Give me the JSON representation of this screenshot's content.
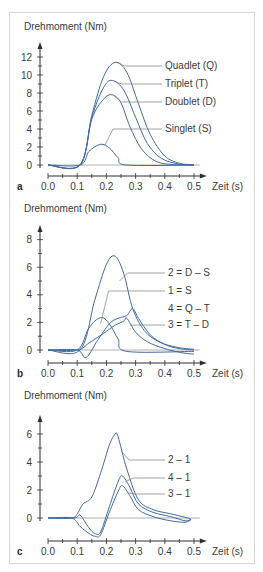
{
  "chart_data": [
    {
      "panel": "a",
      "type": "line",
      "ylabel": "Drehmoment (Nm)",
      "xlabel": "Zeit (s)",
      "xticks": [
        "0.0",
        "0.1",
        "0.2",
        "0.3",
        "0.4",
        "0.5"
      ],
      "yticks": [
        "0",
        "2",
        "4",
        "6",
        "8",
        "10",
        "12"
      ],
      "xlim": [
        0,
        0.5
      ],
      "ylim": [
        0,
        12
      ],
      "grid": false,
      "series": [
        {
          "name": "Quadlet (Q)",
          "x": [
            0,
            0.11,
            0.15,
            0.19,
            0.23,
            0.27,
            0.31,
            0.35,
            0.4,
            0.45,
            0.5
          ],
          "y": [
            0,
            0,
            5.5,
            9.8,
            11.4,
            10.3,
            6.8,
            3.4,
            1.0,
            0.2,
            0
          ]
        },
        {
          "name": "Triplet (T)",
          "x": [
            0,
            0.11,
            0.15,
            0.19,
            0.22,
            0.26,
            0.3,
            0.34,
            0.39,
            0.45,
            0.5
          ],
          "y": [
            0,
            0,
            5.3,
            8.6,
            9.4,
            8.3,
            5.3,
            2.4,
            0.7,
            0.1,
            0
          ]
        },
        {
          "name": "Doublet (D)",
          "x": [
            0,
            0.11,
            0.15,
            0.19,
            0.22,
            0.25,
            0.28,
            0.32,
            0.37,
            0.43,
            0.5
          ],
          "y": [
            0,
            0,
            5.1,
            7.3,
            7.8,
            6.9,
            4.3,
            1.8,
            0.4,
            0.05,
            0
          ]
        },
        {
          "name": "Singlet (S)",
          "x": [
            0,
            0.11,
            0.14,
            0.18,
            0.21,
            0.24,
            0.27,
            0.5
          ],
          "y": [
            0,
            0,
            1.5,
            2.3,
            1.9,
            0.8,
            0,
            0
          ]
        }
      ]
    },
    {
      "panel": "b",
      "type": "line",
      "ylabel": "Drehmoment (Nm)",
      "xlabel": "Zeit (s)",
      "xticks": [
        "0.0",
        "0.1",
        "0.2",
        "0.3",
        "0.4",
        "0.5"
      ],
      "yticks": [
        "0",
        "2",
        "4",
        "6",
        "8"
      ],
      "xlim": [
        0,
        0.5
      ],
      "ylim": [
        -0.5,
        8
      ],
      "grid": false,
      "series": [
        {
          "name": "2 = D – S",
          "x": [
            0,
            0.11,
            0.16,
            0.2,
            0.23,
            0.26,
            0.29,
            0.33,
            0.38,
            0.44,
            0.5
          ],
          "y": [
            0,
            0,
            3.6,
            6.2,
            6.8,
            5.5,
            3.0,
            1.4,
            0.6,
            0.2,
            0.05
          ]
        },
        {
          "name": "1 = S",
          "x": [
            0,
            0.1,
            0.14,
            0.18,
            0.21,
            0.24,
            0.27,
            0.5
          ],
          "y": [
            0,
            0,
            1.6,
            2.35,
            1.9,
            0.8,
            -0.1,
            -0.1
          ]
        },
        {
          "name": "4 = Q – T",
          "x": [
            0,
            0.1,
            0.13,
            0.17,
            0.21,
            0.24,
            0.27,
            0.29,
            0.31,
            0.35,
            0.4,
            0.45,
            0.5
          ],
          "y": [
            0,
            0,
            -0.55,
            0.7,
            1.9,
            2.3,
            2.5,
            3.0,
            2.3,
            1.1,
            0.4,
            0.1,
            0
          ]
        },
        {
          "name": "3 = T – D",
          "x": [
            0,
            0.1,
            0.14,
            0.19,
            0.23,
            0.26,
            0.27,
            0.3,
            0.34,
            0.4,
            0.46,
            0.5
          ],
          "y": [
            0,
            0,
            0.5,
            1.2,
            1.8,
            2.1,
            2.3,
            1.3,
            0.6,
            0.1,
            -0.2,
            -0.3
          ]
        }
      ]
    },
    {
      "panel": "c",
      "type": "line",
      "ylabel": "Drehmoment (Nm)",
      "xlabel": "Zeit (s)",
      "xticks": [
        "0.0",
        "0.1",
        "0.2",
        "0.3",
        "0.4",
        "0.5"
      ],
      "yticks": [
        "0",
        "2",
        "4",
        "6"
      ],
      "xlim": [
        0,
        0.5
      ],
      "ylim": [
        -1.5,
        6.5
      ],
      "grid": false,
      "series": [
        {
          "name": "2 – 1",
          "x": [
            0,
            0.08,
            0.1,
            0.12,
            0.15,
            0.18,
            0.21,
            0.23,
            0.24,
            0.27,
            0.31,
            0.36,
            0.42,
            0.47,
            0.49
          ],
          "y": [
            0,
            0,
            0.3,
            1.0,
            1.5,
            3.2,
            5.2,
            6.0,
            5.8,
            3.5,
            1.3,
            0.6,
            0.3,
            0.05,
            -0.1
          ]
        },
        {
          "name": "4 – 1",
          "x": [
            0,
            0.09,
            0.11,
            0.14,
            0.16,
            0.18,
            0.21,
            0.24,
            0.255,
            0.28,
            0.31,
            0.36,
            0.42,
            0.47,
            0.49
          ],
          "y": [
            0,
            0,
            0.2,
            -0.7,
            -1.1,
            -1.0,
            0.8,
            2.6,
            3.0,
            2.2,
            1.0,
            0.4,
            0.1,
            -0.2,
            -0.1
          ]
        },
        {
          "name": "3 – 1",
          "x": [
            0,
            0.08,
            0.11,
            0.14,
            0.16,
            0.18,
            0.21,
            0.24,
            0.255,
            0.28,
            0.31,
            0.36,
            0.42,
            0.47,
            0.49
          ],
          "y": [
            0,
            0,
            -0.6,
            -1.1,
            -1.3,
            -1.2,
            0.4,
            1.9,
            2.3,
            1.6,
            0.6,
            0.1,
            -0.2,
            -0.3,
            -0.1
          ]
        }
      ]
    }
  ],
  "colors": {
    "curve": "#3f6b9c",
    "axis": "#2f2f2f",
    "leader": "#7b7b7b",
    "frame": "#d9d6cf"
  }
}
